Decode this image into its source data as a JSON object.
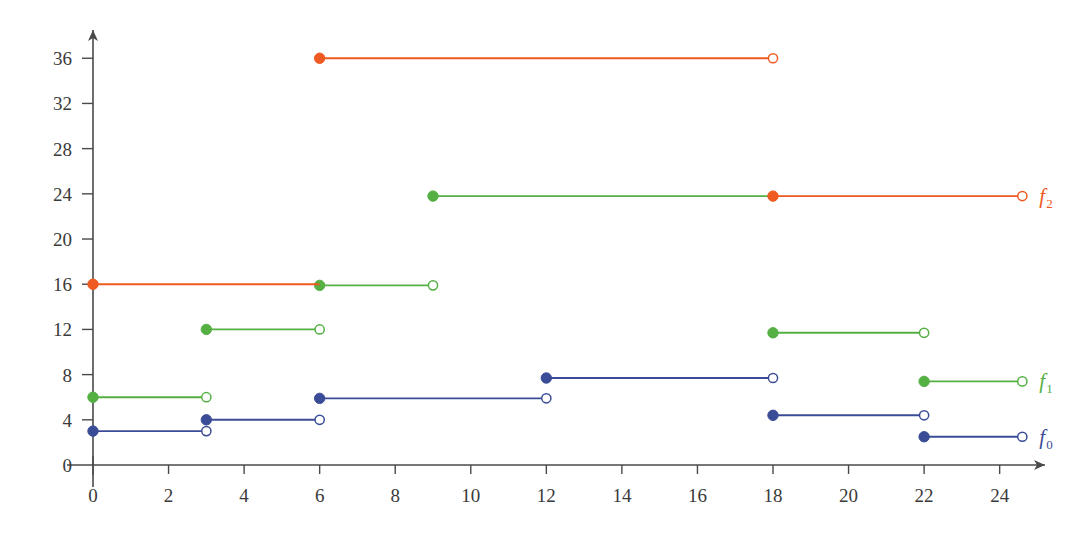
{
  "chart_data": {
    "type": "line",
    "title": "",
    "xlabel": "",
    "ylabel": "",
    "xlim": [
      0,
      25.2
    ],
    "ylim": [
      0,
      38.5
    ],
    "grid": false,
    "legend_position": "right-inline",
    "x_ticks": [
      0,
      2,
      4,
      6,
      8,
      10,
      12,
      14,
      16,
      18,
      20,
      22,
      24
    ],
    "y_ticks": [
      0,
      4,
      8,
      12,
      16,
      20,
      24,
      28,
      32,
      36
    ],
    "style": "step-function with closed (filled) and open (hollow) endpoint markers",
    "series": [
      {
        "name": "f_0",
        "label": "f",
        "sublabel": "0",
        "color": "#3b4c96",
        "segments": [
          {
            "x0": 0,
            "x1": 3,
            "y": 3.0,
            "left_closed": true,
            "right_open": true
          },
          {
            "x0": 3,
            "x1": 6,
            "y": 4.0,
            "left_closed": true,
            "right_open": true
          },
          {
            "x0": 6,
            "x1": 12,
            "y": 5.9,
            "left_closed": true,
            "right_open": true
          },
          {
            "x0": 12,
            "x1": 18,
            "y": 7.7,
            "left_closed": true,
            "right_open": true
          },
          {
            "x0": 18,
            "x1": 22,
            "y": 4.4,
            "left_closed": true,
            "right_open": true
          },
          {
            "x0": 22,
            "x1": 24.6,
            "y": 2.5,
            "left_closed": true,
            "right_open": true
          }
        ]
      },
      {
        "name": "f_1",
        "label": "f",
        "sublabel": "1",
        "color": "#55b044",
        "segments": [
          {
            "x0": 0,
            "x1": 3,
            "y": 6.0,
            "left_closed": true,
            "right_open": true
          },
          {
            "x0": 3,
            "x1": 6,
            "y": 12.0,
            "left_closed": true,
            "right_open": true
          },
          {
            "x0": 6,
            "x1": 9,
            "y": 15.9,
            "left_closed": true,
            "right_open": true
          },
          {
            "x0": 9,
            "x1": 18,
            "y": 23.8,
            "left_closed": true,
            "right_open": false
          },
          {
            "x0": 18,
            "x1": 22,
            "y": 11.7,
            "left_closed": true,
            "right_open": true
          },
          {
            "x0": 22,
            "x1": 24.6,
            "y": 7.4,
            "left_closed": true,
            "right_open": true
          }
        ]
      },
      {
        "name": "f_2",
        "label": "f",
        "sublabel": "2",
        "color": "#ee5a22",
        "segments": [
          {
            "x0": 0,
            "x1": 6,
            "y": 16.0,
            "left_closed": true,
            "right_open": false
          },
          {
            "x0": 6,
            "x1": 18,
            "y": 36.0,
            "left_closed": true,
            "right_open": true
          },
          {
            "x0": 18,
            "x1": 24.6,
            "y": 23.8,
            "left_closed": true,
            "right_open": true
          }
        ]
      }
    ]
  },
  "axes": {
    "x_axis_name": "x-axis",
    "y_axis_name": "y-axis",
    "origin_label": "0"
  }
}
